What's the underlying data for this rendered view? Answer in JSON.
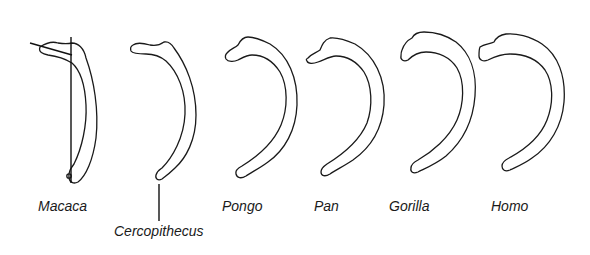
{
  "figure": {
    "specimens": [
      {
        "id": "macaca",
        "label": "Macaca"
      },
      {
        "id": "cercopithecus",
        "label": "Cercopithecus"
      },
      {
        "id": "pongo",
        "label": "Pongo"
      },
      {
        "id": "pan",
        "label": "Pan"
      },
      {
        "id": "gorilla",
        "label": "Gorilla"
      },
      {
        "id": "homo",
        "label": "Homo"
      }
    ],
    "colors": {
      "stroke": "#1a1a1a",
      "background": "#ffffff"
    }
  }
}
